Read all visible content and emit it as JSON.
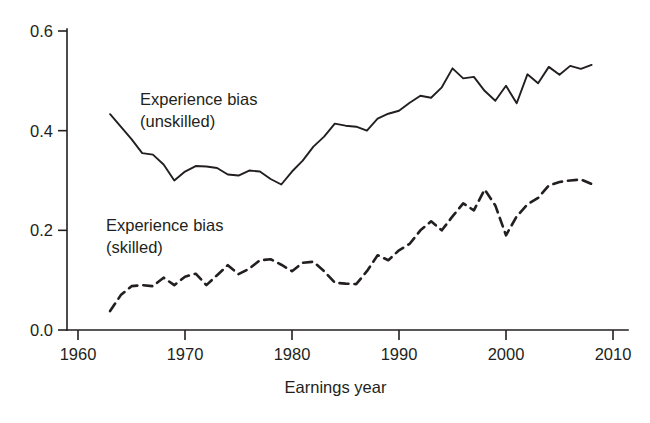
{
  "chart_data": {
    "type": "line",
    "title": "",
    "xlabel": "Earnings year",
    "ylabel": "",
    "xlim": [
      1960,
      2010
    ],
    "ylim": [
      0.0,
      0.6
    ],
    "grid": false,
    "legend_position": "inline-annotations",
    "xticks": [
      1960,
      1970,
      1980,
      1990,
      2000,
      2010
    ],
    "xtick_labels": [
      "1960",
      "1970",
      "1980",
      "1990",
      "2000",
      "2010"
    ],
    "yticks": [
      0.0,
      0.2,
      0.4,
      0.6
    ],
    "ytick_labels": [
      "0.0",
      "0.2",
      "0.4",
      "0.6"
    ],
    "line_color": "#231f20",
    "background_color": "#ffffff",
    "x": [
      1963,
      1964,
      1965,
      1966,
      1967,
      1968,
      1969,
      1970,
      1971,
      1972,
      1973,
      1974,
      1975,
      1976,
      1977,
      1978,
      1979,
      1980,
      1981,
      1982,
      1983,
      1984,
      1985,
      1986,
      1987,
      1988,
      1989,
      1990,
      1991,
      1992,
      1993,
      1994,
      1995,
      1996,
      1997,
      1998,
      1999,
      2000,
      2001,
      2002,
      2003,
      2004,
      2005,
      2006,
      2007,
      2008
    ],
    "series": [
      {
        "name": "Experience bias (unskilled)",
        "style": "solid",
        "values": [
          0.433,
          0.408,
          0.383,
          0.355,
          0.352,
          0.332,
          0.3,
          0.318,
          0.329,
          0.328,
          0.325,
          0.312,
          0.31,
          0.32,
          0.318,
          0.303,
          0.292,
          0.318,
          0.34,
          0.368,
          0.388,
          0.414,
          0.41,
          0.408,
          0.4,
          0.424,
          0.434,
          0.44,
          0.456,
          0.47,
          0.466,
          0.487,
          0.525,
          0.505,
          0.508,
          0.48,
          0.46,
          0.49,
          0.455,
          0.513,
          0.495,
          0.528,
          0.512,
          0.53,
          0.524,
          0.532
        ]
      },
      {
        "name": "Experience bias (skilled)",
        "style": "dashed",
        "values": [
          0.038,
          0.07,
          0.088,
          0.09,
          0.088,
          0.105,
          0.09,
          0.107,
          0.113,
          0.09,
          0.11,
          0.13,
          0.112,
          0.123,
          0.14,
          0.142,
          0.131,
          0.118,
          0.135,
          0.137,
          0.118,
          0.095,
          0.093,
          0.092,
          0.118,
          0.15,
          0.14,
          0.16,
          0.173,
          0.2,
          0.218,
          0.2,
          0.228,
          0.254,
          0.24,
          0.282,
          0.25,
          0.19,
          0.228,
          0.252,
          0.265,
          0.29,
          0.297,
          0.3,
          0.302,
          0.293
        ]
      }
    ],
    "annotations": [
      {
        "id": "unskilled-label",
        "lines": [
          "Experience bias",
          "(unskilled)"
        ],
        "x_px": 140,
        "y_px": 105
      },
      {
        "id": "skilled-label",
        "lines": [
          "Experience bias",
          "(skilled)"
        ],
        "x_px": 106,
        "y_px": 231
      }
    ]
  }
}
